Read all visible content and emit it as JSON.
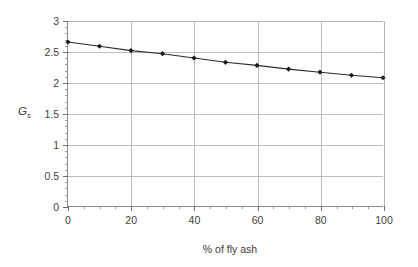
{
  "chart_data": {
    "type": "line",
    "title": "",
    "subtitle": "",
    "xlabel": "% of fly ash",
    "ylabel": "G",
    "ylabel_sub": "s",
    "xlim": [
      0,
      100
    ],
    "ylim": [
      0,
      3
    ],
    "grid": true,
    "legend": false,
    "legend_position": "none",
    "x_ticks": [
      0,
      20,
      40,
      60,
      80,
      100
    ],
    "x_tick_labels": [
      "0",
      "20",
      "40",
      "60",
      "80",
      "100"
    ],
    "x_minor_step": 5,
    "y_ticks": [
      0,
      0.5,
      1,
      1.5,
      2,
      2.5,
      3
    ],
    "y_tick_labels": [
      "0",
      "0.5",
      "1",
      "1.5",
      "2",
      "2.5",
      "3"
    ],
    "y_minor_step": 0.1,
    "series": [
      {
        "name": "Gs vs % fly ash",
        "marker": "diamond",
        "x": [
          0,
          10,
          20,
          30,
          40,
          50,
          60,
          70,
          80,
          90,
          100
        ],
        "values": [
          2.66,
          2.59,
          2.52,
          2.47,
          2.4,
          2.33,
          2.28,
          2.22,
          2.17,
          2.12,
          2.08
        ]
      }
    ]
  },
  "style": {
    "line_color": "#2b2b2b",
    "marker_color": "#1a1a1a",
    "grid_color": "#bdbdbd",
    "axis_color": "#8a8a8a",
    "text_color": "#3a3a3a",
    "background": "#ffffff"
  }
}
